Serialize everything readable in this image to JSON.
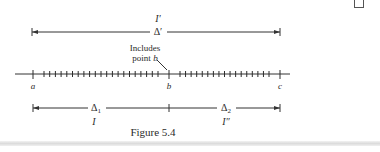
{
  "figure": {
    "caption": "Figure 5.4",
    "top_interval": {
      "label_above": "I′",
      "label_on_line": "Δ′"
    },
    "annotation": {
      "line1": "Includes",
      "line2": "point ",
      "point_name": "b"
    },
    "axis": {
      "points": [
        {
          "name": "a"
        },
        {
          "name": "b"
        },
        {
          "name": "c"
        }
      ],
      "minor_ticks_a_to_b": 21,
      "minor_ticks_b_to_c": 17
    },
    "sub_intervals": [
      {
        "delta_label": "Δ",
        "delta_sub": "1",
        "interval_label": "I"
      },
      {
        "delta_label": "Δ",
        "delta_sub": "2",
        "interval_label": "I″"
      }
    ]
  },
  "colors": {
    "ink": "#2a2a2a",
    "shadow": "#dcdcdc"
  }
}
